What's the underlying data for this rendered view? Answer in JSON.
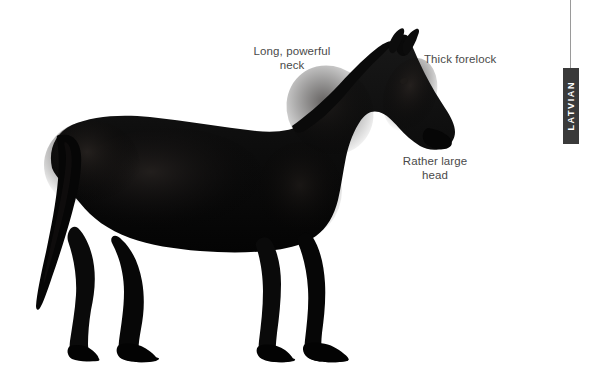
{
  "page": {
    "background_color": "#ffffff",
    "width": 595,
    "height": 384
  },
  "figure": {
    "breed": "Latvian",
    "coat_color": "#0b0b0b",
    "orientation": "facing right"
  },
  "annotations": [
    {
      "id": "neck",
      "text": "Long, powerful\nneck",
      "color": "#4a4a4a"
    },
    {
      "id": "forelock",
      "text": "Thick forelock",
      "color": "#4a4a4a"
    },
    {
      "id": "head",
      "text": "Rather large\nhead",
      "color": "#4a4a4a"
    }
  ],
  "side_tab": {
    "label": "LATVIAN",
    "background_color": "#3a3a3a",
    "text_color": "#ffffff"
  }
}
